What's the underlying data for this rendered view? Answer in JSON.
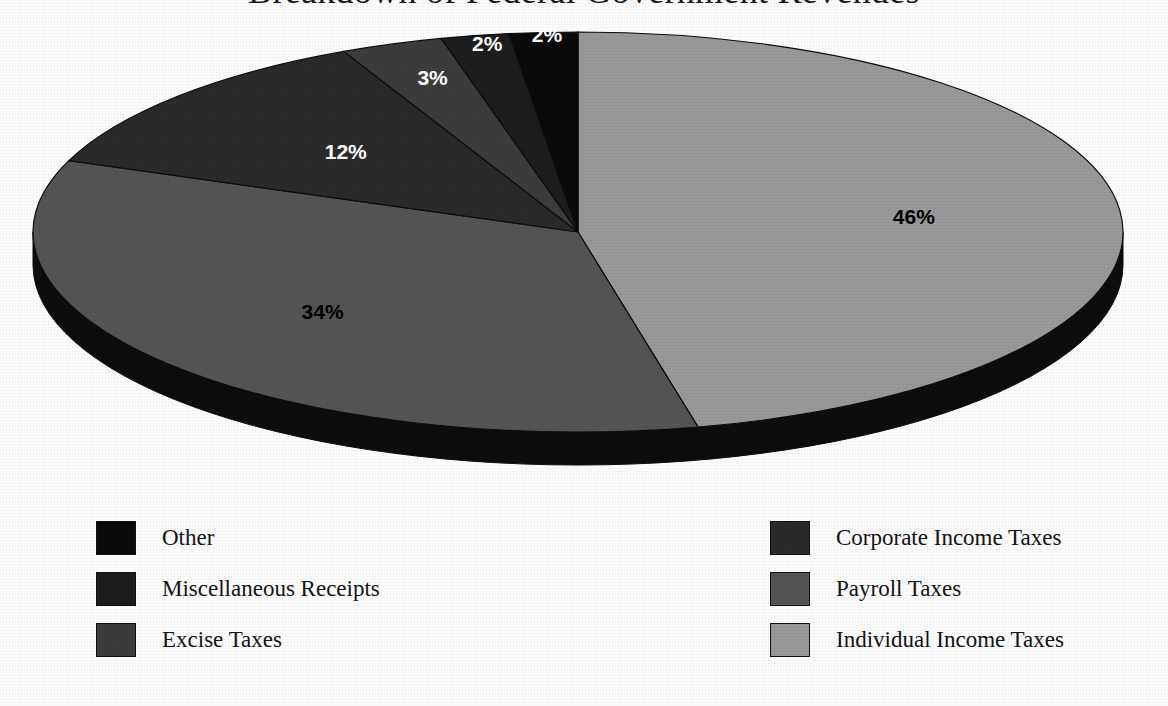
{
  "title": "Breakdown of Federal Government Revenues",
  "chart_data": {
    "type": "pie",
    "title": "Breakdown of Federal Government Revenues",
    "xlabel": "",
    "ylabel": "",
    "legend_position": "bottom",
    "grid": false,
    "three_d": true,
    "start_angle_deg": 0,
    "direction": "clockwise",
    "categories": [
      "Individual Income Taxes",
      "Payroll Taxes",
      "Corporate Income Taxes",
      "Excise Taxes",
      "Miscellaneous Receipts",
      "Other"
    ],
    "values": [
      46,
      34,
      12,
      3,
      2,
      2
    ],
    "value_labels": [
      "46%",
      "34%",
      "12%",
      "3%",
      "2%",
      "2%"
    ],
    "colors": [
      "#9a9a9a",
      "#555555",
      "#2b2b2b",
      "#3c3c3c",
      "#1d1d1d",
      "#0a0a0a"
    ],
    "label_colors": [
      "#000000",
      "#000000",
      "#ffffff",
      "#ffffff",
      "#ffffff",
      "#ffffff"
    ],
    "base_color": "#0d0d0d"
  },
  "slices": [
    {
      "label": "46%",
      "value": 46,
      "name": "Individual Income Taxes",
      "color": "#9a9a9a",
      "text_color": "on-light"
    },
    {
      "label": "34%",
      "value": 34,
      "name": "Payroll Taxes",
      "color": "#555555",
      "text_color": "on-light"
    },
    {
      "label": "12%",
      "value": 12,
      "name": "Corporate Income Taxes",
      "color": "#2b2b2b",
      "text_color": "on-dark"
    },
    {
      "label": "3%",
      "value": 3,
      "name": "Excise Taxes",
      "color": "#3c3c3c",
      "text_color": "on-dark"
    },
    {
      "label": "2%",
      "value": 2,
      "name": "Miscellaneous Receipts",
      "color": "#1d1d1d",
      "text_color": "on-dark"
    },
    {
      "label": "2%",
      "value": 2,
      "name": "Other",
      "color": "#0a0a0a",
      "text_color": "on-dark"
    }
  ],
  "legend": {
    "left_column": [
      {
        "label": "Other",
        "color": "#0a0a0a"
      },
      {
        "label": "Miscellaneous Receipts",
        "color": "#1d1d1d"
      },
      {
        "label": "Excise Taxes",
        "color": "#3c3c3c"
      }
    ],
    "right_column": [
      {
        "label": "Corporate Income Taxes",
        "color": "#2b2b2b"
      },
      {
        "label": "Payroll Taxes",
        "color": "#555555"
      },
      {
        "label": "Individual Income Taxes",
        "color": "#9a9a9a"
      }
    ]
  }
}
